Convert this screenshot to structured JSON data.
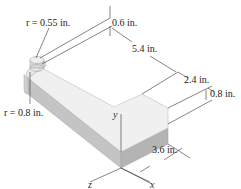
{
  "figure": {
    "type": "isometric-bent-bar",
    "colors": {
      "top_face": "#f2f2f2",
      "front_face": "#bdbdbd",
      "side_face": "#d6d6d6",
      "edge": "#9a9a9a",
      "dim_line": "#333333"
    },
    "dimensions": [
      {
        "id": "r_top",
        "label": "r = 0.55 in."
      },
      {
        "id": "r_bottom",
        "label": "r = 0.8 in."
      },
      {
        "id": "d_06",
        "label": "0.6 in."
      },
      {
        "id": "d_54",
        "label": "5.4 in."
      },
      {
        "id": "d_24",
        "label": "2.4 in."
      },
      {
        "id": "d_08",
        "label": "0.8 in."
      },
      {
        "id": "d_36",
        "label": "3.6 in."
      }
    ],
    "axes": [
      {
        "id": "y",
        "label": "y"
      },
      {
        "id": "z",
        "label": "z"
      },
      {
        "id": "x",
        "label": "x"
      }
    ]
  }
}
